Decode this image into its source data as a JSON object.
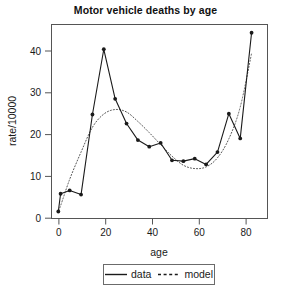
{
  "chart_data": {
    "type": "line",
    "title": "Motor vehicle deaths by age",
    "xlabel": "age",
    "ylabel": "rate/10000",
    "xlim": [
      -3,
      92
    ],
    "ylim": [
      -1.5,
      45.5
    ],
    "xticks": [
      0,
      20,
      40,
      60,
      80
    ],
    "yticks": [
      0,
      10,
      20,
      30,
      40
    ],
    "grid": false,
    "legend_position": "bottom",
    "x": [
      0,
      1,
      5,
      10,
      15,
      20,
      25,
      30,
      35,
      40,
      45,
      50,
      55,
      60,
      65,
      70,
      75,
      80,
      85
    ],
    "series": [
      {
        "name": "data",
        "style": "solid",
        "marker": "filled-circle",
        "color": "#1a1a1a",
        "values": [
          0.2,
          4.5,
          5.3,
          4.3,
          23.7,
          39.5,
          27.5,
          21.5,
          17.5,
          15.9,
          16.8,
          12.6,
          12.4,
          13.0,
          11.6,
          14.6,
          23.9,
          17.9,
          43.5
        ]
      },
      {
        "name": "model",
        "style": "dotted",
        "marker": "none",
        "color": "#555555",
        "values": [
          0.5,
          1.6,
          8.0,
          14.6,
          20.6,
          23.8,
          24.9,
          24.3,
          22.0,
          19.3,
          16.4,
          13.6,
          11.4,
          10.6,
          11.0,
          13.2,
          17.8,
          25.5,
          38.5
        ]
      }
    ]
  },
  "legend": {
    "entries": [
      {
        "label": "data",
        "style": "solid"
      },
      {
        "label": "model",
        "style": "dotted"
      }
    ]
  },
  "axes": {
    "x_tick_labels": [
      "0",
      "20",
      "40",
      "60",
      "80"
    ],
    "y_tick_labels": [
      "0",
      "10",
      "20",
      "30",
      "40"
    ]
  },
  "colors": {
    "background": "#ffffff",
    "frame": "#555555",
    "data_line": "#1a1a1a",
    "model_line": "#555555",
    "text": "#1a1a1a"
  }
}
